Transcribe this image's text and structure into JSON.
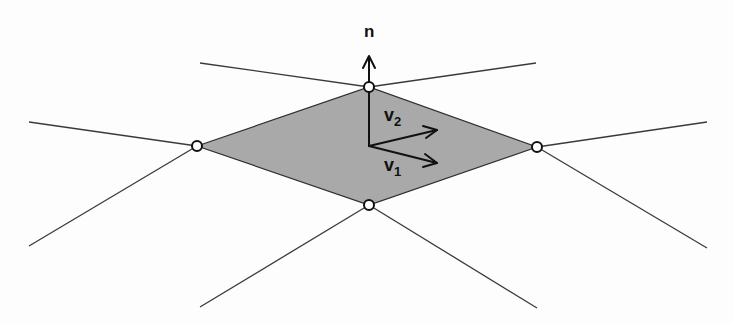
{
  "diagram": {
    "title": "",
    "colors": {
      "background": "#fdfdfd",
      "face_fill": "#a9a9a9",
      "line": "#3a3a3a",
      "vertex_fill": "#ffffff",
      "vertex_stroke": "#111111"
    },
    "face": {
      "vertices": [
        [
          197,
          146
        ],
        [
          369,
          87
        ],
        [
          537,
          147
        ],
        [
          369,
          205
        ]
      ]
    },
    "vertices": [
      {
        "name": "left",
        "x": 197,
        "y": 146
      },
      {
        "name": "top",
        "x": 369,
        "y": 87
      },
      {
        "name": "right",
        "x": 537,
        "y": 147
      },
      {
        "name": "bottom",
        "x": 369,
        "y": 205
      }
    ],
    "edges": [
      {
        "from": [
          29,
          122
        ],
        "to": [
          197,
          146
        ]
      },
      {
        "from": [
          29,
          246
        ],
        "to": [
          197,
          146
        ]
      },
      {
        "from": [
          200,
          63
        ],
        "to": [
          369,
          87
        ]
      },
      {
        "from": [
          536,
          63
        ],
        "to": [
          369,
          87
        ]
      },
      {
        "from": [
          707,
          122
        ],
        "to": [
          537,
          147
        ]
      },
      {
        "from": [
          707,
          248
        ],
        "to": [
          537,
          147
        ]
      },
      {
        "from": [
          200,
          307
        ],
        "to": [
          369,
          205
        ]
      },
      {
        "from": [
          537,
          308
        ],
        "to": [
          369,
          205
        ]
      }
    ],
    "vectors": [
      {
        "name": "n",
        "from": [
          369,
          146
        ],
        "to": [
          369,
          56
        ]
      },
      {
        "name": "v2",
        "from": [
          369,
          146
        ],
        "to": [
          437,
          130
        ]
      },
      {
        "name": "v1",
        "from": [
          369,
          146
        ],
        "to": [
          437,
          163
        ]
      }
    ],
    "labels": {
      "n": "n",
      "v2_base": "v",
      "v2_sub": "2",
      "v1_base": "v",
      "v1_sub": "1"
    }
  }
}
